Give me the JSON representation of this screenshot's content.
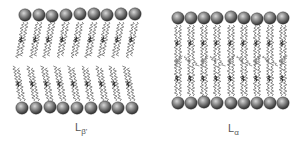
{
  "figure": {
    "panels": [
      {
        "id": "gel-phase",
        "label_main": "L",
        "label_sub": "β'",
        "label_pos": [
          75,
          130
        ],
        "heads_top": {
          "y": 15,
          "x": [
            25,
            39,
            52,
            66,
            80,
            94,
            107,
            121,
            135
          ],
          "dy": [
            0,
            0,
            1,
            0,
            -1,
            -1,
            0,
            -1,
            -1
          ]
        },
        "heads_bottom": {
          "y": 108,
          "x": [
            22,
            36,
            50,
            63,
            77,
            91,
            105,
            118,
            132
          ],
          "dy": [
            0,
            0,
            -1,
            0,
            0,
            0,
            -1,
            0,
            0
          ]
        },
        "tail_top_start": 22,
        "tail_top_end": 58,
        "tail_bottom_start": 66,
        "tail_bottom_end": 101,
        "tilt": -6
      },
      {
        "id": "liquid-crystalline-phase",
        "label_main": "L",
        "label_sub": "α",
        "label_pos": [
          228,
          131
        ],
        "heads_top": {
          "y": 18,
          "x": [
            178,
            191,
            204,
            217,
            231,
            244,
            257,
            270,
            283
          ],
          "dy": [
            0,
            0,
            0,
            0,
            -1,
            0,
            1,
            0,
            0
          ]
        },
        "heads_bottom": {
          "y": 103,
          "x": [
            178,
            191,
            204,
            217,
            231,
            244,
            257,
            270,
            283
          ],
          "dy": [
            0,
            0,
            -1,
            0,
            0,
            0,
            0,
            0,
            0
          ]
        },
        "tail_top_start": 25,
        "tail_top_end": 62,
        "tail_bottom_start": 60,
        "tail_bottom_end": 96,
        "tilt": 0
      }
    ],
    "colors": {
      "head_light": "#c8c8c8",
      "head_dark": "#3a3a3a",
      "tail": "#6a6a6a",
      "tail_dark": "#2a2a2a",
      "label": "#555555"
    }
  }
}
